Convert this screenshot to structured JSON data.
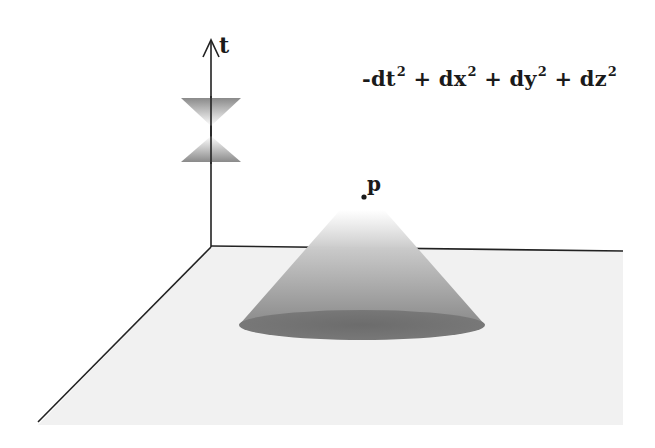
{
  "diagram": {
    "axis_t_label": "t",
    "point_label": "p",
    "metric": {
      "terms": [
        {
          "prefix": "-dt",
          "exp": "2"
        },
        {
          "prefix": "+ dx",
          "exp": "2"
        },
        {
          "prefix": "+ dy",
          "exp": "2"
        },
        {
          "prefix": "+ dz",
          "exp": "2"
        }
      ]
    },
    "colors": {
      "plane": "#f1f1f1",
      "axis": "#222222",
      "cone_dark": "#6e6e6e",
      "cone_light": "#ffffff",
      "base_ellipse": "#6a6a6a"
    }
  }
}
